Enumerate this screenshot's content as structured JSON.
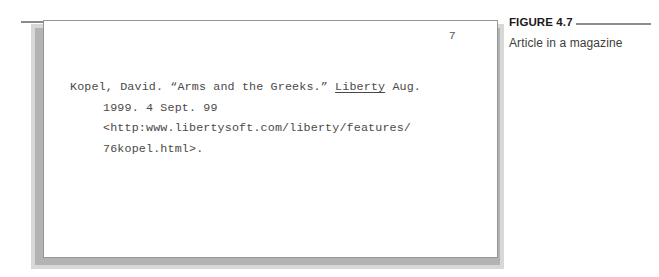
{
  "figure": {
    "label": "FIGURE 4.7",
    "caption": "Article in a magazine"
  },
  "page": {
    "page_number": "7",
    "citation_lines": [
      {
        "segments": [
          {
            "text": "Kopel, David. “Arms and the Greeks.” ",
            "style": "plain"
          },
          {
            "text": "Liberty",
            "style": "underline"
          },
          {
            "text": " Aug.",
            "style": "plain"
          }
        ],
        "indent": false
      },
      {
        "segments": [
          {
            "text": "1999. 4 Sept. 99",
            "style": "plain"
          }
        ],
        "indent": true
      },
      {
        "segments": [
          {
            "text": "<http:www.libertysoft.com/liberty/features/",
            "style": "plain"
          }
        ],
        "indent": true
      },
      {
        "segments": [
          {
            "text": "76kopel.html>.",
            "style": "plain"
          }
        ],
        "indent": true
      }
    ],
    "citation_plain_text": "Kopel, David. “Arms and the Greeks.” Liberty Aug. 1999. 4 Sept. 99 <http:www.libertysoft.com/liberty/features/76kopel.html>."
  },
  "colors": {
    "page_background": "#ffffff",
    "page_border": "#959595",
    "rule": "#8c8c8c",
    "shadow": "#b3b3b3",
    "body_text": "#4a4a4a",
    "caption_label_text": "#1a1a1a",
    "caption_text": "#3d3d3d"
  }
}
